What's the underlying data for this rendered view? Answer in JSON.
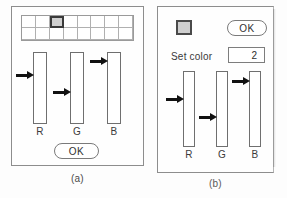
{
  "figure": {
    "caption_a": "(a)",
    "caption_b": "(b)"
  },
  "panel_a": {
    "palette": {
      "columns": 8,
      "rows": 2,
      "selected_index": 2,
      "selected_fill": "#cfcfcf",
      "cell_fill": "#ffffff"
    },
    "sliders": [
      {
        "label": "R",
        "pointer_level": 0.32
      },
      {
        "label": "G",
        "pointer_level": 0.55
      },
      {
        "label": "B",
        "pointer_level": 0.12
      }
    ],
    "ok_label": "OK"
  },
  "panel_b": {
    "swatch_color": "#cfcfcf",
    "ok_label": "OK",
    "set_color_label": "Set color",
    "set_color_value": "2",
    "sliders": [
      {
        "label": "R",
        "pointer_level": 0.38
      },
      {
        "label": "G",
        "pointer_level": 0.62
      },
      {
        "label": "B",
        "pointer_level": 0.14
      }
    ]
  }
}
